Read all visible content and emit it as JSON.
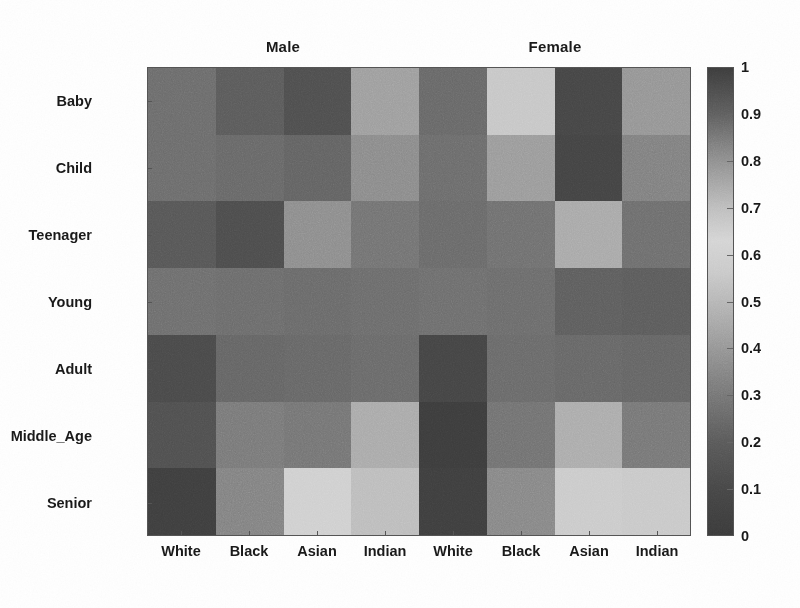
{
  "figure": {
    "type": "heatmap",
    "background_color": "#ffffff",
    "text_color": "#1a1a1a"
  },
  "group_headers": [
    {
      "label": "Male",
      "center_x": 283
    },
    {
      "label": "Female",
      "center_x": 555
    }
  ],
  "row_labels": [
    "Baby",
    "Child",
    "Teenager",
    "Young",
    "Adult",
    "Middle_Age",
    "Senior"
  ],
  "col_labels": [
    "White",
    "Black",
    "Asian",
    "Indian",
    "White",
    "Black",
    "Asian",
    "Indian"
  ],
  "colorbar": {
    "min": 0,
    "max": 1,
    "tick_labels": [
      "1",
      "0.9",
      "0.8",
      "0.7",
      "0.6",
      "0.5",
      "0.4",
      "0.3",
      "0.2",
      "0.1",
      "0"
    ],
    "tick_values": [
      1,
      0.9,
      0.8,
      0.7,
      0.6,
      0.5,
      0.4,
      0.3,
      0.2,
      0.1,
      0
    ],
    "colormap_stops": [
      {
        "value": 0.0,
        "color": "#3a3a3a"
      },
      {
        "value": 0.1,
        "color": "#464646"
      },
      {
        "value": 0.2,
        "color": "#595959"
      },
      {
        "value": 0.33,
        "color": "#7d7d7d"
      },
      {
        "value": 0.45,
        "color": "#a6a6a6"
      },
      {
        "value": 0.56,
        "color": "#c8c8c8"
      },
      {
        "value": 0.63,
        "color": "#d4d4d4"
      },
      {
        "value": 0.7,
        "color": "#bdbdbd"
      },
      {
        "value": 0.8,
        "color": "#8f8f8f"
      },
      {
        "value": 0.9,
        "color": "#5e5e5e"
      },
      {
        "value": 1.0,
        "color": "#3c3c3c"
      }
    ]
  },
  "chart_data": {
    "type": "heatmap",
    "title": "",
    "xlabel": "",
    "ylabel": "",
    "grid": false,
    "legend_position": "right",
    "colorbar_label": "",
    "zlim": [
      0,
      1
    ],
    "column_groups": [
      "Male",
      "Female"
    ],
    "columns": [
      "White",
      "Black",
      "Asian",
      "Indian",
      "White",
      "Black",
      "Asian",
      "Indian"
    ],
    "rows": [
      "Baby",
      "Child",
      "Teenager",
      "Young",
      "Adult",
      "Middle_Age",
      "Senior"
    ],
    "values": [
      [
        0.3,
        0.22,
        0.17,
        0.53,
        0.28,
        0.68,
        0.12,
        0.49
      ],
      [
        0.3,
        0.28,
        0.26,
        0.44,
        0.3,
        0.51,
        0.11,
        0.38
      ],
      [
        0.2,
        0.16,
        0.45,
        0.33,
        0.29,
        0.32,
        0.55,
        0.31
      ],
      [
        0.31,
        0.3,
        0.29,
        0.3,
        0.31,
        0.3,
        0.24,
        0.23
      ],
      [
        0.15,
        0.27,
        0.28,
        0.29,
        0.13,
        0.29,
        0.28,
        0.27
      ],
      [
        0.18,
        0.36,
        0.34,
        0.58,
        0.09,
        0.33,
        0.59,
        0.35
      ],
      [
        0.1,
        0.4,
        0.72,
        0.64,
        0.1,
        0.42,
        0.7,
        0.69
      ]
    ],
    "cell_shades": [
      [
        "#6b6b6b",
        "#5a5a5a",
        "#4e4e4e",
        "#9d9d9d",
        "#676767",
        "#c6c6c6",
        "#454545",
        "#949494"
      ],
      [
        "#6b6b6b",
        "#676767",
        "#626262",
        "#8a8a8a",
        "#6b6b6b",
        "#9a9a9a",
        "#434343",
        "#7f7f7f"
      ],
      [
        "#565656",
        "#4c4c4c",
        "#8c8c8c",
        "#727272",
        "#696969",
        "#6f6f6f",
        "#a8a8a8",
        "#6d6d6d"
      ],
      [
        "#6d6d6d",
        "#6b6b6b",
        "#696969",
        "#6b6b6b",
        "#6d6d6d",
        "#6b6b6b",
        "#5d5d5d",
        "#5b5b5b"
      ],
      [
        "#494949",
        "#646464",
        "#666666",
        "#696969",
        "#444444",
        "#696969",
        "#666666",
        "#646464"
      ],
      [
        "#4f4f4f",
        "#787878",
        "#747474",
        "#a9a9a9",
        "#3c3c3c",
        "#717171",
        "#ababab",
        "#767676"
      ],
      [
        "#3e3e3e",
        "#818181",
        "#cfcfcf",
        "#bcbcbc",
        "#3e3e3e",
        "#868686",
        "#cacaca",
        "#c8c8c8"
      ]
    ]
  }
}
